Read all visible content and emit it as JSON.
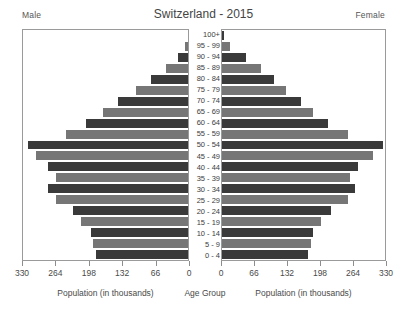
{
  "header": {
    "title": "Switzerland - 2015",
    "male_label": "Male",
    "female_label": "Female"
  },
  "captions": {
    "left": "Population (in thousands)",
    "center": "Age Group",
    "right": "Population (in thousands)"
  },
  "chart_data": {
    "type": "bar",
    "subtype": "population-pyramid",
    "title": "Switzerland - 2015",
    "xlabel": "Population (in thousands)",
    "ylabel": "Age Group",
    "grid": false,
    "legend": [
      "Male",
      "Female"
    ],
    "legend_position": "top-corners",
    "xlim_left": [
      330,
      0
    ],
    "xlim_right": [
      0,
      330
    ],
    "xticks_left": [
      330,
      264,
      198,
      132,
      66,
      0
    ],
    "xticks_right": [
      0,
      66,
      132,
      198,
      264,
      330
    ],
    "categories": [
      "100+",
      "95 - 99",
      "90 - 94",
      "85 - 89",
      "80 - 84",
      "75 - 79",
      "70 - 74",
      "65 - 69",
      "60 - 64",
      "55 - 59",
      "50 - 54",
      "45 - 49",
      "40 - 44",
      "35 - 39",
      "30 - 34",
      "25 - 29",
      "20 - 24",
      "15 - 19",
      "10 - 14",
      "5 - 9",
      "0 - 4"
    ],
    "series": [
      {
        "name": "Male",
        "color": "#3a3a3a",
        "values": [
          1,
          6,
          20,
          45,
          75,
          105,
          140,
          170,
          205,
          245,
          320,
          305,
          280,
          265,
          280,
          265,
          230,
          215,
          195,
          190,
          185
        ]
      },
      {
        "name": "Female",
        "color": "#767676",
        "values": [
          4,
          17,
          48,
          78,
          105,
          130,
          160,
          185,
          215,
          255,
          325,
          305,
          275,
          260,
          270,
          255,
          220,
          200,
          185,
          180,
          175
        ]
      }
    ],
    "bar_colors_alternate": [
      "#3a3a3a",
      "#767676"
    ]
  }
}
